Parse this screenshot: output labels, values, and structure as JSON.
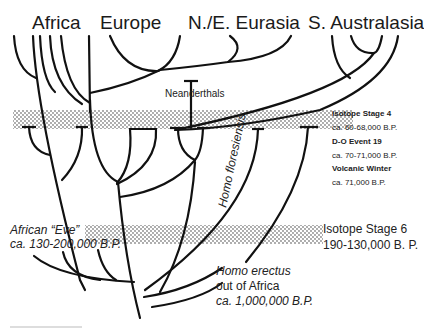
{
  "regions": [
    {
      "id": "africa",
      "label": "Africa"
    },
    {
      "id": "europe",
      "label": "Europe"
    },
    {
      "id": "ne-eurasia",
      "label": "N./E. Eurasia"
    },
    {
      "id": "s-australasia",
      "label": "S. Australasia"
    }
  ],
  "labels": {
    "neanderthals": "Neanderthals",
    "homo_floresiensis": "Homo floresiensis",
    "african_eve_line1": "African “Eve”",
    "african_eve_line2": "ca. 130-200,000 B.P.",
    "homo_erectus_line1": "Homo erectus",
    "homo_erectus_line2": "out of Africa",
    "homo_erectus_line3": "ca. 1,000,000 B.P."
  },
  "events": {
    "isotope_stage_4": {
      "title": "Isotope Stage 4",
      "date": "ca. 60-68,000 B.P."
    },
    "do_event_19": {
      "title": "D-O Event 19",
      "date": "ca. 70-71,000 B.P."
    },
    "volcanic_winter": {
      "title": "Volcanic Winter",
      "date": "ca. 71,000 B.P."
    },
    "isotope_stage_6": {
      "title": "Isotope Stage 6",
      "date": "190-130,000 B. P."
    }
  },
  "colors": {
    "line": "#111111",
    "band_dot": "#555555",
    "background": "#ffffff"
  }
}
